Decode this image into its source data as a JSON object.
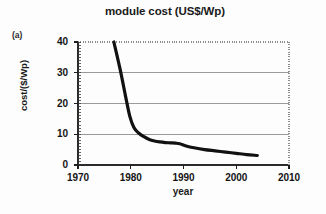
{
  "figure": {
    "panel_label": "(a)",
    "title": "module cost (US$/Wp)"
  },
  "chart_data": {
    "type": "line",
    "title": "module cost (US$/Wp)",
    "xlabel": "year",
    "ylabel": "cost/($/Wp)",
    "xlim": [
      1970,
      2010
    ],
    "ylim": [
      0,
      40
    ],
    "xticks": [
      1970,
      1980,
      1990,
      2000,
      2010
    ],
    "xtick_labels": [
      "1970",
      "1980",
      "1990",
      "2000",
      "2010"
    ],
    "yticks": [
      0,
      10,
      20,
      30,
      40
    ],
    "ytick_labels": [
      "0",
      "10",
      "20",
      "30",
      "40"
    ],
    "grid": "horizontal",
    "legend": "none",
    "series": [
      {
        "name": "module cost",
        "color": "#111111",
        "line_width": 3.2,
        "x": [
          1976.8,
          1978.0,
          1979.0,
          1979.8,
          1980.6,
          1981.5,
          1982.5,
          1983.5,
          1984.5,
          1985.5,
          1986.5,
          1987.5,
          1988.5,
          1989.3,
          1990.5,
          1992.0,
          1994.0,
          1996.0,
          1998.0,
          2000.0,
          2002.0,
          2004.0
        ],
        "y": [
          40.0,
          31.0,
          22.5,
          16.0,
          12.2,
          10.4,
          9.2,
          8.3,
          7.8,
          7.5,
          7.3,
          7.2,
          7.1,
          6.9,
          6.2,
          5.6,
          5.0,
          4.6,
          4.2,
          3.8,
          3.4,
          3.1
        ]
      }
    ]
  }
}
